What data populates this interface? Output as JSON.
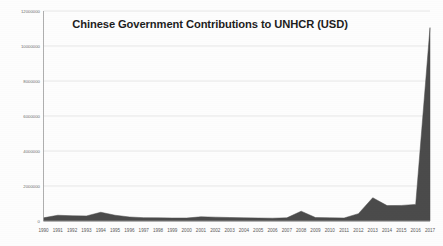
{
  "chart_data": {
    "type": "area",
    "title": "Chinese Government Contributions to UNHCR (USD)",
    "xlabel": "",
    "ylabel": "",
    "grid": true,
    "legend": "none",
    "ylim": [
      0,
      12000000
    ],
    "ytick_labels": [
      "0",
      "2000000",
      "4000000",
      "6000000",
      "8000000",
      "10000000",
      "12000000"
    ],
    "ytick_values": [
      0,
      2000000,
      4000000,
      6000000,
      8000000,
      10000000,
      12000000
    ],
    "categories": [
      "1990",
      "1991",
      "1992",
      "1993",
      "1994",
      "1995",
      "1996",
      "1997",
      "1998",
      "1999",
      "2000",
      "2001",
      "2002",
      "2003",
      "2004",
      "2005",
      "2006",
      "2007",
      "2008",
      "2009",
      "2010",
      "2011",
      "2012",
      "2013",
      "2014",
      "2015",
      "2016",
      "2017"
    ],
    "values": [
      180000,
      330000,
      300000,
      290000,
      500000,
      330000,
      230000,
      190000,
      180000,
      170000,
      170000,
      240000,
      220000,
      200000,
      180000,
      170000,
      160000,
      180000,
      560000,
      200000,
      180000,
      170000,
      420000,
      1330000,
      880000,
      890000,
      950000,
      3100000
    ],
    "series_name": "Chinese Government Contributions",
    "fill_color": "#4b4b4b",
    "grid_color": "#dcdcdc",
    "axis_color": "#9a9a9a",
    "background_color": "#fdfdfd",
    "peak_year": "2017",
    "peak_value": 11050000,
    "note": "2017 final data point spikes to approximately 11,050,000 USD"
  }
}
